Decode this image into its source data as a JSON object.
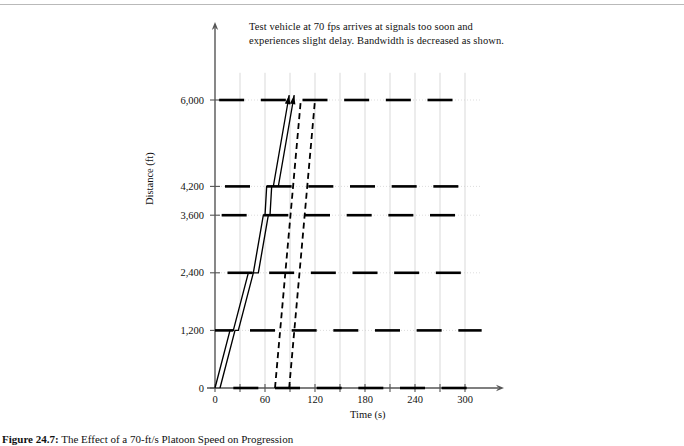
{
  "figure": {
    "caption_label": "Figure 24.7:",
    "caption_text": "The Effect of a 70-ft/s Platoon Speed on Progression"
  },
  "annotation": {
    "text": "Test vehicle at 70 fps arrives at signals too soon and experiences slight delay. Bandwidth is decreased as shown."
  },
  "axes": {
    "y_title": "Distance (ft)",
    "x_title": "Time (s)"
  },
  "chart_data": {
    "type": "line",
    "title": "The Effect of a 70-ft/s Platoon Speed on Progression",
    "xlabel": "Time (s)",
    "ylabel": "Distance (ft)",
    "xlim": [
      0,
      320
    ],
    "ylim": [
      0,
      6400
    ],
    "grid": true,
    "legend_position": "none",
    "x_ticks": [
      0,
      60,
      120,
      180,
      240,
      300
    ],
    "x_tick_labels": [
      "0",
      "60",
      "120",
      "180",
      "240",
      "300"
    ],
    "x_minor_ticks": [
      30,
      90,
      150,
      210,
      270
    ],
    "y_ticks": [
      0,
      1200,
      2400,
      3600,
      4200,
      6000
    ],
    "y_tick_labels": [
      "0",
      "1,200",
      "2,400",
      "3,600",
      "4,200",
      "6,000"
    ],
    "signal_rows": [
      {
        "distance": 0,
        "green_bands": [
          [
            22,
            52
          ],
          [
            72,
            102
          ],
          [
            122,
            152
          ],
          [
            172,
            202
          ],
          [
            222,
            252
          ],
          [
            272,
            302
          ]
        ]
      },
      {
        "distance": 1200,
        "green_bands": [
          [
            -8,
            22
          ],
          [
            42,
            72
          ],
          [
            92,
            122
          ],
          [
            142,
            172
          ],
          [
            192,
            222
          ],
          [
            242,
            272
          ],
          [
            292,
            320
          ]
        ]
      },
      {
        "distance": 2400,
        "green_bands": [
          [
            15,
            45
          ],
          [
            65,
            95
          ],
          [
            115,
            145
          ],
          [
            165,
            195
          ],
          [
            215,
            245
          ],
          [
            265,
            295
          ]
        ]
      },
      {
        "distance": 3600,
        "green_bands": [
          [
            8,
            38
          ],
          [
            58,
            88
          ],
          [
            108,
            138
          ],
          [
            158,
            188
          ],
          [
            208,
            238
          ],
          [
            258,
            288
          ]
        ]
      },
      {
        "distance": 4200,
        "green_bands": [
          [
            12,
            42
          ],
          [
            62,
            92
          ],
          [
            112,
            142
          ],
          [
            162,
            192
          ],
          [
            212,
            242
          ],
          [
            262,
            292
          ]
        ]
      },
      {
        "distance": 6000,
        "green_bands": [
          [
            5,
            35
          ],
          [
            55,
            85
          ],
          [
            105,
            135
          ],
          [
            155,
            185
          ],
          [
            205,
            235
          ],
          [
            255,
            285
          ]
        ]
      }
    ],
    "trajectories": [
      {
        "name": "leading-platoon-edge",
        "style": "solid",
        "arrow": true,
        "points": [
          [
            0,
            0
          ],
          [
            18,
            1200
          ],
          [
            22,
            1200
          ],
          [
            40,
            2400
          ],
          [
            46,
            2400
          ],
          [
            58,
            3600
          ],
          [
            60,
            3600
          ],
          [
            62,
            4200
          ],
          [
            70,
            4200
          ],
          [
            88,
            6000
          ]
        ]
      },
      {
        "name": "trailing-platoon-edge",
        "style": "solid",
        "arrow": true,
        "points": [
          [
            6,
            0
          ],
          [
            24,
            1200
          ],
          [
            28,
            1200
          ],
          [
            46,
            2400
          ],
          [
            52,
            2400
          ],
          [
            64,
            3600
          ],
          [
            66,
            3600
          ],
          [
            68,
            4200
          ],
          [
            76,
            4200
          ],
          [
            94,
            6000
          ]
        ]
      },
      {
        "name": "reverse-band-leading-edge",
        "style": "dashed",
        "arrow": false,
        "points": [
          [
            72,
            0
          ],
          [
            103,
            6000
          ]
        ]
      },
      {
        "name": "reverse-band-trailing-edge",
        "style": "dashed",
        "arrow": false,
        "points": [
          [
            89,
            0
          ],
          [
            120,
            6000
          ]
        ]
      }
    ]
  }
}
